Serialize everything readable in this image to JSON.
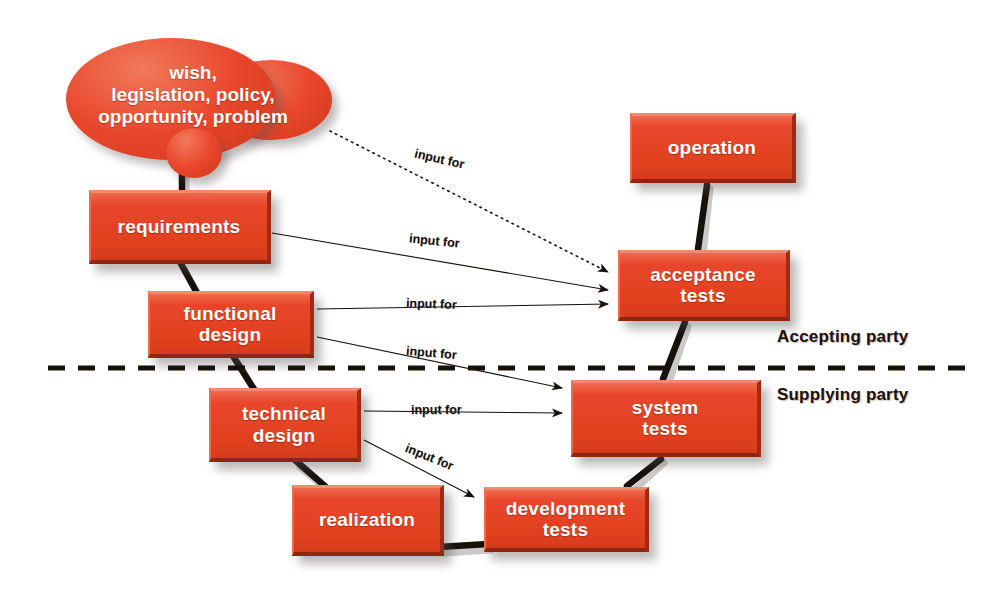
{
  "diagram": {
    "colors": {
      "node_fill": "#e8462b",
      "node_highlight": "#f08b72",
      "node_shadow": "#8e2610",
      "text": "#ffffff",
      "line": "#1a140f",
      "background": "#ffffff"
    },
    "cloud": {
      "label": "wish,\nlegislation, policy,\nopportunity, problem",
      "line1": "wish,",
      "line2": "legislation, policy,",
      "line3": "opportunity, problem"
    },
    "nodes": [
      {
        "id": "requirements",
        "label": "requirements",
        "line1": "requirements",
        "line2": "",
        "x": 89,
        "y": 190,
        "w": 182,
        "h": 74
      },
      {
        "id": "functional-design",
        "label": "functional design",
        "line1": "functional",
        "line2": "design",
        "x": 148,
        "y": 291,
        "w": 166,
        "h": 67
      },
      {
        "id": "technical-design",
        "label": "technical design",
        "line1": "technical",
        "line2": "design",
        "x": 209,
        "y": 388,
        "w": 152,
        "h": 74
      },
      {
        "id": "realization",
        "label": "realization",
        "line1": "realization",
        "line2": "",
        "x": 292,
        "y": 485,
        "w": 152,
        "h": 71
      },
      {
        "id": "development-tests",
        "label": "development tests",
        "line1": "development",
        "line2": "tests",
        "x": 484,
        "y": 487,
        "w": 165,
        "h": 65
      },
      {
        "id": "system-tests",
        "label": "system tests",
        "line1": "system",
        "line2": "tests",
        "x": 571,
        "y": 380,
        "w": 190,
        "h": 77
      },
      {
        "id": "acceptance-tests",
        "label": "acceptance tests",
        "line1": "acceptance",
        "line2": "tests",
        "x": 618,
        "y": 250,
        "w": 172,
        "h": 71
      },
      {
        "id": "operation",
        "label": "operation",
        "line1": "operation",
        "line2": "",
        "x": 630,
        "y": 113,
        "w": 166,
        "h": 70
      }
    ],
    "party_labels": [
      {
        "id": "accepting-party",
        "label": "Accepting party",
        "x": 777,
        "y": 327
      },
      {
        "id": "supplying-party",
        "label": "Supplying party",
        "x": 777,
        "y": 385
      }
    ],
    "divider": {
      "label": "party-divider",
      "y": 368,
      "x1": 48,
      "x2": 966,
      "style": "dashed"
    },
    "edge_labels": [
      {
        "id": "input-for-1",
        "label": "input for",
        "x": 414,
        "y": 152,
        "rotate": 13
      },
      {
        "id": "input-for-2",
        "label": "input for",
        "x": 409,
        "y": 234,
        "rotate": 6
      },
      {
        "id": "input-for-3",
        "label": "input for",
        "x": 406,
        "y": 297,
        "rotate": 3
      },
      {
        "id": "input-for-4",
        "label": "input for",
        "x": 406,
        "y": 348,
        "rotate": 5
      },
      {
        "id": "input-for-5",
        "label": "input for",
        "x": 411,
        "y": 403,
        "rotate": 0
      },
      {
        "id": "input-for-6",
        "label": "input for",
        "x": 404,
        "y": 452,
        "rotate": 22
      }
    ],
    "input_arrows": [
      {
        "id": "cloud-to-acceptance-tests",
        "from": "cloud",
        "to": "acceptance-tests",
        "x1": 330,
        "y1": 130,
        "x2": 612,
        "y2": 272,
        "style": "dotted"
      },
      {
        "id": "requirements-to-acceptance",
        "from": "requirements",
        "to": "acceptance-tests",
        "x1": 272,
        "y1": 232,
        "x2": 612,
        "y2": 290,
        "style": "solid"
      },
      {
        "id": "functional-to-acceptance",
        "from": "functional-design",
        "to": "acceptance-tests",
        "x1": 316,
        "y1": 308,
        "x2": 612,
        "y2": 305,
        "style": "solid"
      },
      {
        "id": "functional-to-system-tests",
        "from": "functional-design",
        "to": "system-tests",
        "x1": 316,
        "y1": 336,
        "x2": 566,
        "y2": 388,
        "style": "solid"
      },
      {
        "id": "technical-to-system-tests",
        "from": "technical-design",
        "to": "system-tests",
        "x1": 364,
        "y1": 410,
        "x2": 566,
        "y2": 412,
        "style": "solid"
      },
      {
        "id": "technical-to-development-tests",
        "from": "technical-design",
        "to": "development-tests",
        "x1": 364,
        "y1": 440,
        "x2": 478,
        "y2": 497,
        "style": "solid"
      }
    ],
    "chain_connectors": [
      {
        "id": "cloud-to-requirements",
        "from": "cloud",
        "to": "requirements"
      },
      {
        "id": "requirements-to-functional",
        "from": "requirements",
        "to": "functional-design"
      },
      {
        "id": "functional-to-technical",
        "from": "functional-design",
        "to": "technical-design"
      },
      {
        "id": "technical-to-realization",
        "from": "technical-design",
        "to": "realization"
      },
      {
        "id": "realization-to-development-tests",
        "from": "realization",
        "to": "development-tests"
      },
      {
        "id": "development-tests-to-system",
        "from": "development-tests",
        "to": "system-tests"
      },
      {
        "id": "system-to-acceptance",
        "from": "system-tests",
        "to": "acceptance-tests"
      },
      {
        "id": "acceptance-to-operation",
        "from": "acceptance-tests",
        "to": "operation"
      }
    ]
  }
}
